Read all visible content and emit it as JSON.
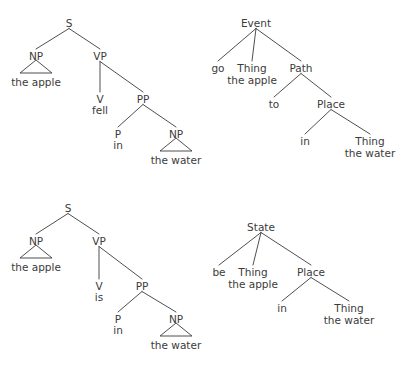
{
  "figure": {
    "kind": "syntax-and-conceptual-structure-trees",
    "background_color": "#ffffff",
    "ink_color": "#3b3b3b",
    "panel_count": 4
  },
  "trees": [
    {
      "id": "syntax-tree-fell",
      "title": "Syntactic tree: the apple fell in the water",
      "sentence": "the apple fell in the water",
      "nodes": [
        {
          "id": "s",
          "label": "S",
          "x": 69,
          "y": 18,
          "lines": [
            "S"
          ]
        },
        {
          "id": "np1",
          "label": "NP",
          "x": 36,
          "y": 51,
          "lines": [
            "NP"
          ]
        },
        {
          "id": "np1leaf",
          "label": "the apple",
          "x": 36,
          "y": 77,
          "lines": [
            "the apple"
          ]
        },
        {
          "id": "vp",
          "label": "VP",
          "x": 100,
          "y": 51,
          "lines": [
            "VP"
          ]
        },
        {
          "id": "v",
          "label": "V",
          "x": 100,
          "y": 94,
          "lines": [
            "V"
          ]
        },
        {
          "id": "vleaf",
          "label": "fell",
          "x": 100,
          "y": 105,
          "lines": [
            "fell"
          ]
        },
        {
          "id": "pp",
          "label": "PP",
          "x": 143,
          "y": 94,
          "lines": [
            "PP"
          ]
        },
        {
          "id": "p",
          "label": "P",
          "x": 118,
          "y": 129,
          "lines": [
            "P"
          ]
        },
        {
          "id": "pleaf",
          "label": "in",
          "x": 118,
          "y": 140,
          "lines": [
            "in"
          ]
        },
        {
          "id": "np2",
          "label": "NP",
          "x": 176,
          "y": 129,
          "lines": [
            "NP"
          ]
        },
        {
          "id": "np2leaf",
          "label": "the water",
          "x": 176,
          "y": 155,
          "lines": [
            "the water"
          ]
        }
      ],
      "edges": [
        {
          "from": "s",
          "to": "np1"
        },
        {
          "from": "s",
          "to": "vp"
        },
        {
          "from": "vp",
          "to": "v"
        },
        {
          "from": "vp",
          "to": "pp"
        },
        {
          "from": "pp",
          "to": "p"
        },
        {
          "from": "pp",
          "to": "np2"
        }
      ],
      "triangles": [
        {
          "id": "triangle-the-apple",
          "apex_x": 36,
          "apex_y": 60,
          "half_width": 16,
          "base_y": 73
        },
        {
          "id": "triangle-the-water",
          "apex_x": 176,
          "apex_y": 138,
          "half_width": 16,
          "base_y": 151
        }
      ]
    },
    {
      "id": "conceptual-tree-event-go",
      "title": "Conceptual structure: Event go",
      "nodes": [
        {
          "id": "event",
          "label": "Event",
          "x": 256,
          "y": 18,
          "lines": [
            "Event"
          ]
        },
        {
          "id": "go",
          "label": "go",
          "x": 218,
          "y": 63,
          "lines": [
            "go"
          ]
        },
        {
          "id": "thing1",
          "label": "Thing the apple",
          "x": 252,
          "y": 63,
          "lines": [
            "Thing",
            "the apple"
          ]
        },
        {
          "id": "path",
          "label": "Path",
          "x": 301,
          "y": 63,
          "lines": [
            "Path"
          ]
        },
        {
          "id": "to",
          "label": "to",
          "x": 274,
          "y": 99,
          "lines": [
            "to"
          ]
        },
        {
          "id": "place",
          "label": "Place",
          "x": 331,
          "y": 99,
          "lines": [
            "Place"
          ]
        },
        {
          "id": "in",
          "label": "in",
          "x": 305,
          "y": 136,
          "lines": [
            "in"
          ]
        },
        {
          "id": "thing2",
          "label": "Thing the water",
          "x": 370,
          "y": 136,
          "lines": [
            "Thing",
            "the water"
          ]
        }
      ],
      "edges": [
        {
          "from": "event",
          "to": "go"
        },
        {
          "from": "event",
          "to": "thing1"
        },
        {
          "from": "event",
          "to": "path"
        },
        {
          "from": "path",
          "to": "to"
        },
        {
          "from": "path",
          "to": "place"
        },
        {
          "from": "place",
          "to": "in"
        },
        {
          "from": "place",
          "to": "thing2"
        }
      ],
      "triangles": []
    },
    {
      "id": "syntax-tree-is",
      "title": "Syntactic tree: the apple is in the water",
      "sentence": "the apple is in the water",
      "nodes": [
        {
          "id": "s2",
          "label": "S",
          "x": 68,
          "y": 203,
          "lines": [
            "S"
          ]
        },
        {
          "id": "np3",
          "label": "NP",
          "x": 36,
          "y": 236,
          "lines": [
            "NP"
          ]
        },
        {
          "id": "np3leaf",
          "label": "the apple",
          "x": 36,
          "y": 262,
          "lines": [
            "the apple"
          ]
        },
        {
          "id": "vp2",
          "label": "VP",
          "x": 99,
          "y": 236,
          "lines": [
            "VP"
          ]
        },
        {
          "id": "v2",
          "label": "V",
          "x": 99,
          "y": 281,
          "lines": [
            "V"
          ]
        },
        {
          "id": "v2leaf",
          "label": "is",
          "x": 99,
          "y": 292,
          "lines": [
            "is"
          ]
        },
        {
          "id": "pp2",
          "label": "PP",
          "x": 142,
          "y": 281,
          "lines": [
            "PP"
          ]
        },
        {
          "id": "p2",
          "label": "P",
          "x": 118,
          "y": 314,
          "lines": [
            "P"
          ]
        },
        {
          "id": "p2leaf",
          "label": "in",
          "x": 118,
          "y": 325,
          "lines": [
            "in"
          ]
        },
        {
          "id": "np4",
          "label": "NP",
          "x": 176,
          "y": 314,
          "lines": [
            "NP"
          ]
        },
        {
          "id": "np4leaf",
          "label": "the water",
          "x": 176,
          "y": 340,
          "lines": [
            "the water"
          ]
        }
      ],
      "edges": [
        {
          "from": "s2",
          "to": "np3"
        },
        {
          "from": "s2",
          "to": "vp2"
        },
        {
          "from": "vp2",
          "to": "v2"
        },
        {
          "from": "vp2",
          "to": "pp2"
        },
        {
          "from": "pp2",
          "to": "p2"
        },
        {
          "from": "pp2",
          "to": "np4"
        }
      ],
      "triangles": [
        {
          "id": "triangle-the-apple-2",
          "apex_x": 36,
          "apex_y": 245,
          "half_width": 16,
          "base_y": 258
        },
        {
          "id": "triangle-the-water-2",
          "apex_x": 176,
          "apex_y": 323,
          "half_width": 16,
          "base_y": 336
        }
      ]
    },
    {
      "id": "conceptual-tree-state-be",
      "title": "Conceptual structure: State be",
      "nodes": [
        {
          "id": "state",
          "label": "State",
          "x": 261,
          "y": 222,
          "lines": [
            "State"
          ]
        },
        {
          "id": "be",
          "label": "be",
          "x": 219,
          "y": 267,
          "lines": [
            "be"
          ]
        },
        {
          "id": "thing3",
          "label": "Thing the apple",
          "x": 253,
          "y": 267,
          "lines": [
            "Thing",
            "the apple"
          ]
        },
        {
          "id": "place2",
          "label": "Place",
          "x": 311,
          "y": 267,
          "lines": [
            "Place"
          ]
        },
        {
          "id": "in2",
          "label": "in",
          "x": 282,
          "y": 303,
          "lines": [
            "in"
          ]
        },
        {
          "id": "thing4",
          "label": "Thing the water",
          "x": 349,
          "y": 303,
          "lines": [
            "Thing",
            "the water"
          ]
        }
      ],
      "edges": [
        {
          "from": "state",
          "to": "be"
        },
        {
          "from": "state",
          "to": "thing3"
        },
        {
          "from": "state",
          "to": "place2"
        },
        {
          "from": "place2",
          "to": "in2"
        },
        {
          "from": "place2",
          "to": "thing4"
        }
      ],
      "triangles": []
    }
  ]
}
